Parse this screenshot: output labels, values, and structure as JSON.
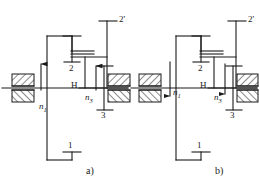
{
  "figure": {
    "type": "kinematic-schematic",
    "stroke_color": "#1a1a1a",
    "background_color": "#ffffff",
    "hatch_color": "#1a1a1a"
  },
  "diagrams": [
    {
      "id": "a",
      "caption": "a)",
      "labels": {
        "gear1": "1",
        "gear2": "2",
        "gear2p": "2'",
        "gear3": "3",
        "carrier": "H",
        "input_speed": "n",
        "input_speed_sub": "1",
        "output_speed": "n",
        "output_speed_sub": "3",
        "input_arrow_direction": "up",
        "output_arrow_direction": "up"
      }
    },
    {
      "id": "b",
      "caption": "b)",
      "labels": {
        "gear1": "1",
        "gear2": "2",
        "gear2p": "2'",
        "gear3": "3",
        "carrier": "H",
        "input_speed": "n",
        "input_speed_sub": "1",
        "output_speed": "n",
        "output_speed_sub": "3",
        "input_arrow_direction": "down",
        "output_arrow_direction": "down"
      }
    }
  ]
}
